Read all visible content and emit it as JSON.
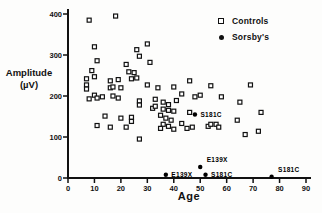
{
  "chart_data": {
    "type": "scatter",
    "title": "",
    "xlabel": "Age",
    "ylabel": "Amplitude (µV)",
    "ylabel_lines": {
      "line1": "Amplitude",
      "line2": "(µV)"
    },
    "xlim": [
      0,
      90
    ],
    "ylim": [
      0,
      400
    ],
    "x_ticks": [
      0,
      10,
      20,
      30,
      40,
      50,
      60,
      70,
      80,
      90
    ],
    "y_ticks": [
      0,
      100,
      200,
      300,
      400
    ],
    "grid": false,
    "legend_position": "top-right",
    "axis_color": "#111111",
    "series": [
      {
        "name": "Controls",
        "marker": "open-square",
        "color": "#111111",
        "points": [
          [
            8,
            385
          ],
          [
            18,
            395
          ],
          [
            10,
            320
          ],
          [
            26,
            313
          ],
          [
            30,
            327
          ],
          [
            27,
            297
          ],
          [
            11,
            286
          ],
          [
            22,
            277
          ],
          [
            31,
            282
          ],
          [
            9,
            262
          ],
          [
            23,
            259
          ],
          [
            25,
            257
          ],
          [
            7,
            242
          ],
          [
            10,
            247
          ],
          [
            16,
            237
          ],
          [
            19,
            240
          ],
          [
            24,
            242
          ],
          [
            26,
            244
          ],
          [
            7,
            227
          ],
          [
            7,
            217
          ],
          [
            16,
            220
          ],
          [
            17,
            222
          ],
          [
            20,
            220
          ],
          [
            30,
            227
          ],
          [
            34,
            220
          ],
          [
            40,
            222
          ],
          [
            10,
            202
          ],
          [
            11,
            195
          ],
          [
            8,
            193
          ],
          [
            13,
            198
          ],
          [
            17,
            200
          ],
          [
            19,
            195
          ],
          [
            27,
            188
          ],
          [
            27,
            178
          ],
          [
            32,
            170
          ],
          [
            33,
            175
          ],
          [
            36,
            168
          ],
          [
            38,
            165
          ],
          [
            40,
            163
          ],
          [
            33,
            192
          ],
          [
            36,
            185
          ],
          [
            38,
            179
          ],
          [
            41,
            189
          ],
          [
            14,
            151
          ],
          [
            20,
            146
          ],
          [
            24,
            148
          ],
          [
            24,
            138
          ],
          [
            11,
            128
          ],
          [
            16,
            124
          ],
          [
            22,
            124
          ],
          [
            35,
            153
          ],
          [
            37,
            146
          ],
          [
            39,
            141
          ],
          [
            36,
            131
          ],
          [
            38,
            126
          ],
          [
            35,
            121
          ],
          [
            40,
            119
          ],
          [
            27,
            95
          ],
          [
            46,
            237
          ],
          [
            54,
            225
          ],
          [
            69,
            227
          ],
          [
            43,
            205
          ],
          [
            48,
            198
          ],
          [
            50,
            202
          ],
          [
            58,
            198
          ],
          [
            65,
            185
          ],
          [
            46,
            160
          ],
          [
            43,
            133
          ],
          [
            45,
            121
          ],
          [
            47,
            124
          ],
          [
            53,
            126
          ],
          [
            54,
            131
          ],
          [
            56,
            131
          ],
          [
            57,
            124
          ],
          [
            64,
            141
          ],
          [
            73,
            160
          ],
          [
            72,
            114
          ],
          [
            67,
            106
          ]
        ]
      },
      {
        "name": "Sorsby's",
        "marker": "filled-circle",
        "color": "#000000",
        "points": [
          [
            37,
            8
          ],
          [
            50,
            27
          ],
          [
            52,
            8
          ],
          [
            77,
            3
          ],
          [
            48,
            155
          ]
        ],
        "point_labels": [
          "E139X",
          "E139X",
          "S181C",
          "S181C",
          "S181C"
        ],
        "label_placement": [
          "right",
          "above-right",
          "right",
          "above-right",
          "right"
        ]
      }
    ]
  }
}
